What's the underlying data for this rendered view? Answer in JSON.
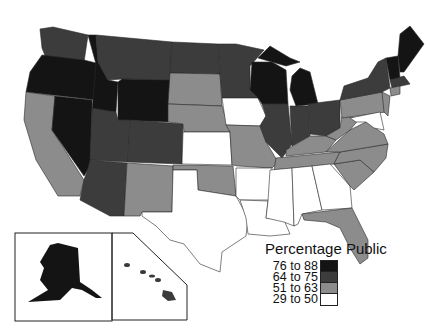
{
  "legend": {
    "title": "Percentage Public",
    "items": [
      {
        "label": "76 to 88",
        "color": "#141414"
      },
      {
        "label": "64 to 75",
        "color": "#3c3c3c"
      },
      {
        "label": "51 to 63",
        "color": "#8c8c8c"
      },
      {
        "label": "29 to 50",
        "color": "#ffffff"
      }
    ]
  },
  "map": {
    "subject": "US states by percentage public",
    "categories": {
      "76 to 88": [
        "Oregon",
        "Idaho",
        "Nevada",
        "Wyoming",
        "Wisconsin",
        "Michigan",
        "Maine",
        "New Hampshire",
        "Vermont"
      ],
      "64 to 75": [
        "Washington",
        "Montana",
        "North Dakota",
        "Minnesota",
        "Utah",
        "Colorado",
        "Arizona",
        "Illinois",
        "Indiana",
        "Ohio",
        "New York",
        "Massachusetts",
        "Rhode Island",
        "Connecticut",
        "Alaska",
        "Hawaii"
      ],
      "51 to 63": [
        "California",
        "South Dakota",
        "Nebraska",
        "New Mexico",
        "Oklahoma",
        "Missouri",
        "Kentucky",
        "Tennessee",
        "West Virginia",
        "Virginia",
        "North Carolina",
        "South Carolina",
        "Pennsylvania",
        "New Jersey",
        "Florida"
      ],
      "29 to 50": [
        "Iowa",
        "Kansas",
        "Texas",
        "Arkansas",
        "Louisiana",
        "Mississippi",
        "Alabama",
        "Georgia",
        "Maryland",
        "Delaware"
      ]
    },
    "insets": [
      "Alaska",
      "Hawaii"
    ]
  }
}
